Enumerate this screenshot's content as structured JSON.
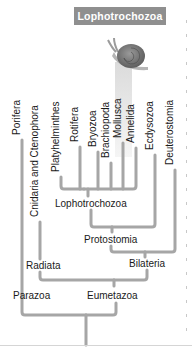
{
  "header": {
    "title": "Lophotrochozoa"
  },
  "colors": {
    "badge_bg": "#8f8f8f",
    "badge_text": "#ffffff",
    "branch": "#a6a6a6",
    "text": "#1a1a1a"
  },
  "taxa": [
    {
      "label": "Porifera"
    },
    {
      "label": "Cnidaria and Ctenophora"
    },
    {
      "label": "Platyhelminthes"
    },
    {
      "label": "Rotifera"
    },
    {
      "label": "Bryozoa"
    },
    {
      "label": "Brachiopoda"
    },
    {
      "label": "Mollusca"
    },
    {
      "label": "Annelida"
    },
    {
      "label": "Ecdysozoa"
    },
    {
      "label": "Deuterostomia"
    }
  ],
  "clades": {
    "lophotrochozoa": "Lophotrochozoa",
    "protostomia": "Protostomia",
    "bilateria": "Bilateria",
    "radiata": "Radiata",
    "parazoa": "Parazoa",
    "eumetazoa": "Eumetazoa"
  },
  "illustration": {
    "icon": "snail-icon",
    "highlighted_taxon": "Mollusca"
  }
}
